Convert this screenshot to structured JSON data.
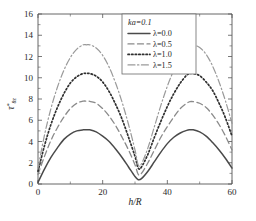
{
  "chart_data": {
    "type": "line",
    "title": "",
    "xlabel": "h/R",
    "ylabel": "τ*θz",
    "xlim": [
      0,
      60
    ],
    "ylim": [
      0,
      16
    ],
    "xticks": [
      0,
      20,
      40,
      60
    ],
    "xtick_labels": [
      "0",
      "20",
      "40",
      "60"
    ],
    "yticks": [
      0,
      2,
      4,
      6,
      8,
      10,
      12,
      14,
      16
    ],
    "ytick_labels": [
      "0",
      "2",
      "4",
      "6",
      "8",
      "10",
      "12",
      "14",
      "16"
    ],
    "grid": false,
    "legend_position": "top-right",
    "legend_title": "ka=0.1",
    "x": [
      0,
      2,
      4,
      6,
      8,
      10,
      12,
      14,
      15,
      16,
      18,
      20,
      22,
      24,
      26,
      28,
      30,
      31,
      32,
      34,
      36,
      38,
      40,
      42,
      44,
      46,
      47,
      48,
      50,
      52,
      54,
      56,
      58,
      60
    ],
    "series": [
      {
        "name": "λ=0.0",
        "label": "λ=0.0",
        "dash": "solid",
        "color": "#4a4a4a",
        "peak1": 5.1,
        "peak1_x": 15,
        "valley": 0.4,
        "valley_x": 31,
        "peak2": 5.1,
        "peak2_x": 47,
        "values": [
          0.15,
          1.4,
          2.5,
          3.4,
          4.2,
          4.7,
          5.0,
          5.1,
          5.1,
          5.1,
          4.9,
          4.5,
          4.0,
          3.3,
          2.5,
          1.6,
          0.7,
          0.4,
          0.5,
          1.2,
          2.1,
          3.0,
          3.8,
          4.4,
          4.8,
          5.05,
          5.1,
          5.1,
          4.9,
          4.5,
          3.9,
          3.2,
          2.4,
          1.5
        ]
      },
      {
        "name": "λ=0.5",
        "label": "λ=0.5",
        "dash": "dashed",
        "color": "#8a8a8a",
        "peak1": 7.8,
        "peak1_x": 15,
        "valley": 0.9,
        "valley_x": 31,
        "peak2": 7.75,
        "peak2_x": 47,
        "values": [
          0.9,
          2.6,
          4.1,
          5.3,
          6.3,
          7.1,
          7.6,
          7.8,
          7.8,
          7.78,
          7.6,
          7.1,
          6.4,
          5.5,
          4.4,
          3.2,
          1.8,
          0.9,
          1.0,
          2.0,
          3.2,
          4.4,
          5.4,
          6.3,
          7.1,
          7.6,
          7.75,
          7.75,
          7.6,
          7.2,
          6.5,
          5.6,
          4.5,
          3.2
        ]
      },
      {
        "name": "λ=1.0",
        "label": "λ=1.0",
        "dash": "dotted",
        "color": "#2f2f2f",
        "peak1": 10.4,
        "peak1_x": 15,
        "valley": 1.5,
        "valley_x": 31,
        "peak2": 10.4,
        "peak2_x": 47,
        "values": [
          1.2,
          3.6,
          5.6,
          7.2,
          8.5,
          9.5,
          10.1,
          10.4,
          10.4,
          10.4,
          10.15,
          9.6,
          8.7,
          7.5,
          6.1,
          4.4,
          2.6,
          1.5,
          1.6,
          2.8,
          4.4,
          5.9,
          7.3,
          8.5,
          9.5,
          10.25,
          10.4,
          10.4,
          10.2,
          9.6,
          8.8,
          7.6,
          6.2,
          4.5
        ]
      },
      {
        "name": "λ=1.5",
        "label": "λ=1.5",
        "dash": "dashdot",
        "color": "#9a9a9a",
        "peak1": 13.1,
        "peak1_x": 15,
        "valley": 1.8,
        "valley_x": 31,
        "peak2": 13.1,
        "peak2_x": 47,
        "values": [
          1.5,
          4.6,
          7.1,
          9.1,
          10.7,
          11.9,
          12.7,
          13.1,
          13.1,
          13.1,
          12.8,
          12.1,
          11.0,
          9.5,
          7.7,
          5.6,
          3.2,
          1.8,
          1.9,
          3.4,
          5.4,
          7.4,
          9.2,
          10.7,
          11.9,
          12.85,
          13.1,
          13.1,
          12.85,
          12.2,
          11.1,
          9.6,
          7.8,
          5.7
        ]
      }
    ]
  },
  "axes": {
    "xlabel_main": "h",
    "xlabel_sep": "/",
    "xlabel_sub": "R",
    "ylabel_tau": "τ",
    "ylabel_star": "*",
    "ylabel_sub": "θz"
  },
  "legend": {
    "title": "ka=0.1",
    "title_k": "k",
    "title_a": "a",
    "title_val": "=0.1",
    "items": [
      {
        "label": "λ=0.0",
        "dash": "solid"
      },
      {
        "label": "λ=0.5",
        "dash": "dashed"
      },
      {
        "label": "λ=1.0",
        "dash": "dotted"
      },
      {
        "label": "λ=1.5",
        "dash": "dashdot"
      }
    ]
  },
  "colors": {
    "axis": "#555555",
    "solid": "#4a4a4a",
    "dashed": "#8a8a8a",
    "dotted": "#2f2f2f",
    "dashdot": "#9a9a9a",
    "background": "#ffffff"
  }
}
